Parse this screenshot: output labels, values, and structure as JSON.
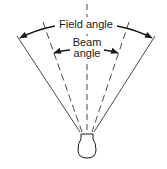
{
  "diagram": {
    "labels": {
      "field_angle": "Field angle",
      "beam_line1": "Beam",
      "beam_line2": "angle"
    },
    "colors": {
      "stroke": "#1a1a1a",
      "background": "#ffffff"
    }
  }
}
